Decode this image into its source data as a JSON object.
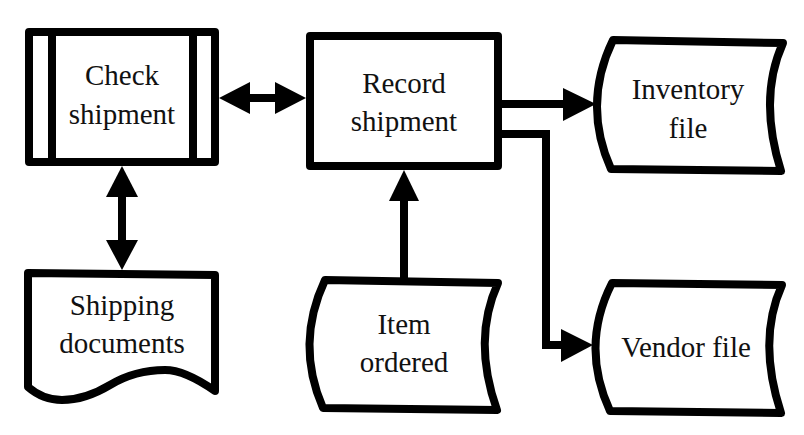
{
  "diagram": {
    "type": "flowchart",
    "nodes": {
      "check_shipment": {
        "shape": "predefined-process",
        "line1": "Check",
        "line2": "shipment"
      },
      "record_shipment": {
        "shape": "process",
        "line1": "Record",
        "line2": "shipment"
      },
      "inventory_file": {
        "shape": "stored-data",
        "line1": "Inventory",
        "line2": "file"
      },
      "shipping_documents": {
        "shape": "document",
        "line1": "Shipping",
        "line2": "documents"
      },
      "item_ordered": {
        "shape": "stored-data",
        "line1": "Item",
        "line2": "ordered"
      },
      "vendor_file": {
        "shape": "stored-data",
        "line1": "Vendor file"
      }
    },
    "edges": [
      {
        "from": "check_shipment",
        "to": "record_shipment",
        "direction": "bidirectional"
      },
      {
        "from": "check_shipment",
        "to": "shipping_documents",
        "direction": "bidirectional"
      },
      {
        "from": "item_ordered",
        "to": "record_shipment",
        "direction": "forward"
      },
      {
        "from": "record_shipment",
        "to": "inventory_file",
        "direction": "forward"
      },
      {
        "from": "record_shipment",
        "to": "vendor_file",
        "direction": "forward"
      }
    ],
    "colors": {
      "stroke": "#000000",
      "fill": "#ffffff",
      "text": "#111111"
    }
  }
}
